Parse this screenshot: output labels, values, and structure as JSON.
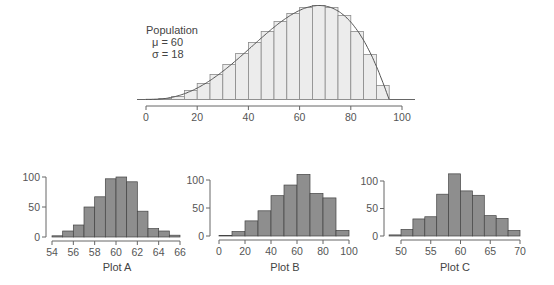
{
  "chart_data": [
    {
      "type": "bar",
      "title": "Population",
      "annotations": [
        "Population",
        "μ = 60",
        "σ = 18"
      ],
      "xlabel": "",
      "ylabel": "",
      "bin_width": 5,
      "bin_starts": [
        0,
        5,
        10,
        15,
        20,
        25,
        30,
        35,
        40,
        45,
        50,
        55,
        60,
        65,
        70,
        75,
        80,
        85,
        90
      ],
      "values": [
        0.3,
        1,
        3,
        9,
        16,
        25,
        35,
        46,
        57,
        68,
        78,
        86,
        92,
        94,
        92,
        84,
        68,
        45,
        14
      ],
      "density_curve": true,
      "xticks": [
        0,
        20,
        40,
        60,
        80,
        100
      ],
      "xlim": [
        0,
        100
      ],
      "yaxis_shown": false,
      "grid": false
    },
    {
      "type": "bar",
      "title": "Plot A",
      "xlabel": "Plot A",
      "bin_width": 1,
      "bin_starts": [
        54,
        55,
        56,
        57,
        58,
        59,
        60,
        61,
        62,
        63,
        64,
        65
      ],
      "values": [
        2,
        10,
        20,
        50,
        67,
        97,
        100,
        92,
        43,
        14,
        10,
        3
      ],
      "xticks": [
        54,
        56,
        58,
        60,
        62,
        64,
        66
      ],
      "yticks": [
        0,
        50,
        100
      ],
      "xlim": [
        54,
        66
      ],
      "ylim": [
        0,
        100
      ],
      "grid": false
    },
    {
      "type": "bar",
      "title": "Plot B",
      "xlabel": "Plot B",
      "bin_width": 10,
      "bin_starts": [
        0,
        10,
        20,
        30,
        40,
        50,
        60,
        70,
        80,
        90
      ],
      "values": [
        1,
        8,
        27,
        45,
        72,
        91,
        110,
        76,
        68,
        10
      ],
      "xticks": [
        0,
        20,
        40,
        60,
        80,
        100
      ],
      "yticks": [
        0,
        50,
        100
      ],
      "xlim": [
        0,
        100
      ],
      "ylim": [
        0,
        110
      ],
      "grid": false
    },
    {
      "type": "bar",
      "title": "Plot C",
      "xlabel": "Plot C",
      "bin_width": 2,
      "bin_starts": [
        48,
        50,
        52,
        54,
        56,
        58,
        60,
        62,
        64,
        66,
        68
      ],
      "values": [
        2,
        12,
        31,
        35,
        76,
        113,
        82,
        74,
        37,
        32,
        10
      ],
      "xticks": [
        50,
        55,
        60,
        65,
        70
      ],
      "yticks": [
        0,
        50,
        100
      ],
      "xlim": [
        48,
        70
      ],
      "ylim": [
        0,
        113
      ],
      "grid": false
    }
  ],
  "population": {
    "label": "Population",
    "mu": "μ = 60",
    "sigma": "σ = 18",
    "ticks": [
      "0",
      "20",
      "40",
      "60",
      "80",
      "100"
    ]
  },
  "plots": [
    {
      "name": "Plot A",
      "xticks": [
        "54",
        "56",
        "58",
        "60",
        "62",
        "64",
        "66"
      ],
      "yticks": [
        "0",
        "50",
        "100"
      ]
    },
    {
      "name": "Plot B",
      "xticks": [
        "0",
        "20",
        "40",
        "60",
        "80",
        "100"
      ],
      "yticks": [
        "0",
        "50",
        "100"
      ]
    },
    {
      "name": "Plot C",
      "xticks": [
        "50",
        "55",
        "60",
        "65",
        "70"
      ],
      "yticks": [
        "0",
        "50",
        "100"
      ]
    }
  ],
  "colors": {
    "population_bar_fill": "#ececec",
    "population_bar_stroke": "#8a8a8a",
    "sample_bar_fill": "#8e8e8e",
    "sample_bar_stroke": "#444444",
    "axis": "#666666"
  }
}
